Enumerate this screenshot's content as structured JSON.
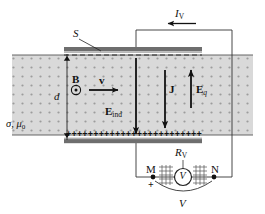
{
  "figure": {
    "colors": {
      "slab_fill": "#d8d8d8",
      "dot_color": "#9a9a9a",
      "plate_dark": "#6a6a6a",
      "plate_light": "#b4b4b4",
      "line": "#1a1a1a",
      "background": "#ffffff"
    }
  },
  "labels": {
    "switch": "S",
    "thickness": "d",
    "medium_sigma": "σ",
    "medium_comma": ",",
    "medium_mu": "μ",
    "medium_mu_sub": "0",
    "magnetic_field": "B",
    "velocity": "v",
    "induced_field": "E",
    "induced_field_sub": "ind",
    "current_density": "J",
    "charge_field": "E",
    "charge_field_sub": "q",
    "voltmeter_current": "I",
    "voltmeter_current_sub": "V",
    "voltmeter_resistance": "R",
    "voltmeter_resistance_sub": "V",
    "voltmeter_symbol": "V",
    "terminal_m": "M",
    "terminal_n": "N",
    "polarity_plus": "+",
    "voltage": "V"
  },
  "charges": {
    "bottom_row_symbol": "+",
    "bottom_row_count": 25
  },
  "icons": {
    "b_field_out_of_page": "dot-in-circle-icon",
    "voltmeter": "voltmeter-circle-icon"
  }
}
